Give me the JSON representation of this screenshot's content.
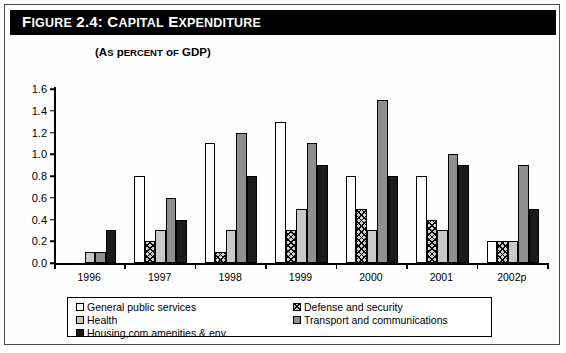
{
  "figure": {
    "title_prefix": "Figure 2.4: ",
    "title_main": "Capital Expenditure",
    "subtitle": "(As percent of GDP)"
  },
  "chart_data": {
    "type": "bar",
    "title": "Figure 2.4: Capital Expenditure",
    "subtitle": "(As percent of GDP)",
    "xlabel": "",
    "ylabel": "",
    "ylim": [
      0.0,
      1.6
    ],
    "ytick_labels": [
      "0.0",
      "0.2",
      "0.4",
      "0.6",
      "0.8",
      "1.0",
      "1.2",
      "1.4",
      "1.6"
    ],
    "ytick_values": [
      0.0,
      0.2,
      0.4,
      0.6,
      0.8,
      1.0,
      1.2,
      1.4,
      1.6
    ],
    "grid": false,
    "legend_position": "below",
    "categories": [
      "1996",
      "1997",
      "1998",
      "1999",
      "2000",
      "2001",
      "2002p"
    ],
    "series": [
      {
        "name": "General public services",
        "fill": "white",
        "color": "#ffffff",
        "values": [
          null,
          0.8,
          1.1,
          1.3,
          0.8,
          0.8,
          0.2
        ]
      },
      {
        "name": "Defense and security",
        "fill": "hatched",
        "color": "#cfcfcf",
        "values": [
          null,
          0.2,
          0.1,
          0.3,
          0.5,
          0.4,
          0.2
        ]
      },
      {
        "name": "Health",
        "fill": "light-gray",
        "color": "#c9c9c9",
        "values": [
          0.1,
          0.3,
          0.3,
          0.5,
          0.3,
          0.3,
          0.2
        ]
      },
      {
        "name": "Transport and communications",
        "fill": "dark-gray",
        "color": "#8f8f8f",
        "values": [
          0.1,
          0.6,
          1.2,
          1.1,
          1.5,
          1.0,
          0.9
        ]
      },
      {
        "name": "Housing,com.amenities & env.",
        "fill": "black",
        "color": "#1a1a1a",
        "values": [
          0.3,
          0.4,
          0.8,
          0.9,
          0.8,
          0.9,
          0.5
        ]
      }
    ]
  },
  "legend": {
    "left_items": [
      {
        "label": "General public services",
        "fill": "white"
      },
      {
        "label": "Health",
        "fill": "light-gray"
      },
      {
        "label": "Housing,com.amenities & env.",
        "fill": "black"
      }
    ],
    "right_items": [
      {
        "label": "Defense and security",
        "fill": "hatched"
      },
      {
        "label": "Transport and communications",
        "fill": "dark-gray"
      }
    ]
  }
}
